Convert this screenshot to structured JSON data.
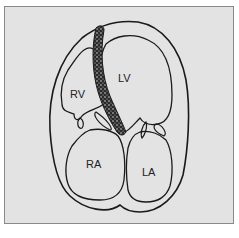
{
  "diagram": {
    "type": "heart-four-chamber-schematic",
    "colors": {
      "background": "#e3e3e3",
      "line": "#1a1a1a",
      "septum_fill": "#3a3a3a"
    },
    "labels": {
      "rv": "RV",
      "lv": "LV",
      "ra": "RA",
      "la": "LA"
    }
  }
}
